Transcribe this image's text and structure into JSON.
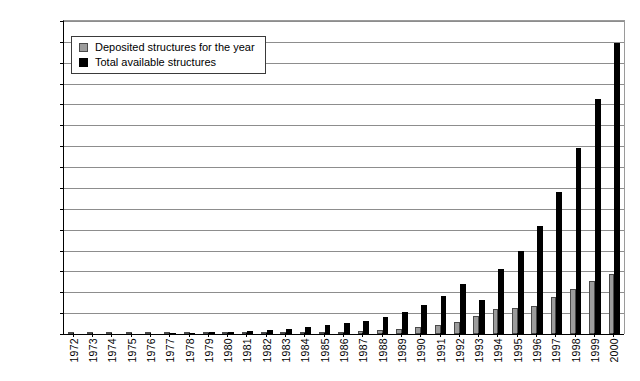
{
  "chart_data": {
    "type": "bar",
    "title": "",
    "subtitle": "",
    "xlabel": "",
    "ylabel": "",
    "ylim": [
      0,
      15000
    ],
    "ytick_step": 1000,
    "grid": true,
    "legend_position": "top-left",
    "categories": [
      "1972",
      "1973",
      "1974",
      "1975",
      "1976",
      "1977",
      "1978",
      "1979",
      "1980",
      "1981",
      "1982",
      "1983",
      "1984",
      "1985",
      "1986",
      "1987",
      "1988",
      "1989",
      "1990",
      "1991",
      "1992",
      "1993",
      "1994",
      "1995",
      "1996",
      "1997",
      "1998",
      "1999",
      "2000"
    ],
    "ytick_labels": [
      "0",
      "1000",
      "2000",
      "3000",
      "4000",
      "5000",
      "6000",
      "7000",
      "8000",
      "9000",
      "10 000",
      "11 000",
      "12 000",
      "13 000",
      "14 000",
      "15 000"
    ],
    "ytick_values": [
      0,
      1000,
      2000,
      3000,
      4000,
      5000,
      6000,
      7000,
      8000,
      9000,
      10000,
      11000,
      12000,
      13000,
      14000,
      15000
    ],
    "series": [
      {
        "name": "Deposited structures for the year",
        "color": "#9c9c9c",
        "values": [
          0,
          1,
          3,
          8,
          12,
          14,
          23,
          26,
          28,
          37,
          48,
          56,
          72,
          87,
          102,
          123,
          188,
          243,
          327,
          420,
          572,
          853,
          1210,
          1250,
          1350,
          1750,
          2150,
          2550,
          2900
        ]
      },
      {
        "name": "Total available structures",
        "color": "#000000",
        "values": [
          0,
          1,
          4,
          12,
          24,
          38,
          61,
          87,
          115,
          152,
          200,
          256,
          328,
          415,
          517,
          640,
          828,
          1071,
          1398,
          1818,
          2390,
          1650,
          3100,
          4000,
          5200,
          6800,
          8900,
          11250,
          13950
        ]
      }
    ]
  },
  "legend": {
    "items": [
      {
        "label": "Deposited structures for the year",
        "swatch": "gray-square-icon"
      },
      {
        "label": "Total available structures",
        "swatch": "black-square-icon"
      }
    ]
  }
}
